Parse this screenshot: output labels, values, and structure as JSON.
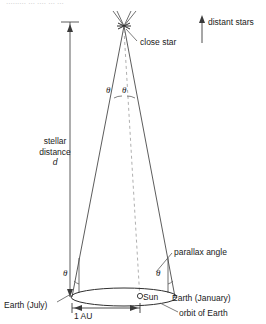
{
  "figure": {
    "top_cut_text": "......... ... .... ... ..."
  },
  "labels": {
    "close_star": "close star",
    "distant_stars": "distant stars",
    "stellar_distance_line1": "stellar",
    "stellar_distance_line2": "distance",
    "stellar_distance_symbol": "d",
    "parallax_angle": "parallax angle",
    "earth_july": "Earth (July)",
    "earth_january": "Earth (January)",
    "orbit_of_earth": "orbit of Earth",
    "sun": "Sun",
    "one_au": "1 AU",
    "theta_apex_left": "θ",
    "theta_apex_right": "θ",
    "theta_left_earth": "θ",
    "theta_right_earth": "θ"
  },
  "icons": {
    "sun_marker": "sun-circle-icon",
    "star_marker": "star-cross-icon",
    "distant_stars_arrow": "up-arrow-icon",
    "distance_measure_arrow": "double-arrow-vertical-icon",
    "au_measure_arrow": "double-arrow-horizontal-icon"
  },
  "colors": {
    "stroke": "#4a4a4a",
    "text": "#1a1a1a",
    "background": "#ffffff",
    "dashed": "#8a8a8a"
  },
  "geometry": {
    "star_x": 124,
    "star_y": 26,
    "earth_july_x": 72,
    "earth_january_x": 175,
    "orbit_y": 297,
    "sun_x": 140,
    "orbit_rx": 52,
    "orbit_ry": 9
  }
}
